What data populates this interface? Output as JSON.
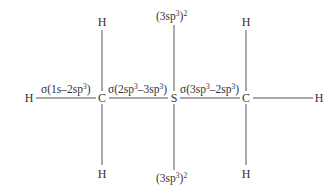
{
  "diagram": {
    "type": "molecular orbital bonding diagram",
    "atoms": {
      "h_left": "H",
      "c1": "C",
      "s": "S",
      "c2": "C",
      "h_right": "H",
      "c1_h_top": "H",
      "c1_h_bottom": "H",
      "c2_h_top": "H",
      "c2_h_bottom": "H"
    },
    "bonds": {
      "h_c1": {
        "prefix": "σ(1s–2sp",
        "sup": "3",
        "suffix": ")"
      },
      "c1_s": {
        "prefix": "σ(2sp",
        "sup1": "3",
        "mid": "–3sp",
        "sup2": "3",
        "suffix": ")"
      },
      "s_c2": {
        "prefix": "σ(3sp",
        "sup1": "3",
        "mid": "–2sp",
        "sup2": "3",
        "suffix": ")"
      }
    },
    "lone_pairs": {
      "top": {
        "prefix": "(3sp",
        "sup1": "3",
        "mid": ")",
        "sup2": "2"
      },
      "bottom": {
        "prefix": "(3sp",
        "sup1": "3",
        "mid": ")",
        "sup2": "2"
      }
    }
  }
}
